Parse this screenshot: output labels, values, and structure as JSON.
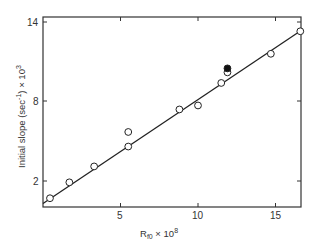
{
  "chart_data": {
    "type": "scatter",
    "title": "",
    "xlabel": "R_f0 × 10^8",
    "ylabel": "Initial slope (sec^-1) × 10^3",
    "xlim": [
      0,
      16.7
    ],
    "ylim": [
      0,
      14.3
    ],
    "x_ticks": [
      5,
      10,
      15
    ],
    "y_ticks": [
      2,
      8,
      14
    ],
    "grid": false,
    "legend": null,
    "series": [
      {
        "name": "open circles",
        "marker": "open-circle",
        "points": [
          [
            0.45,
            0.7
          ],
          [
            1.7,
            1.9
          ],
          [
            3.3,
            3.1
          ],
          [
            5.5,
            5.7
          ],
          [
            5.5,
            4.6
          ],
          [
            8.8,
            7.4
          ],
          [
            10.0,
            7.7
          ],
          [
            11.5,
            9.4
          ],
          [
            11.9,
            10.2
          ],
          [
            14.7,
            11.6
          ],
          [
            16.6,
            13.3
          ]
        ]
      },
      {
        "name": "filled circle",
        "marker": "filled-circle",
        "points": [
          [
            11.9,
            10.5
          ]
        ]
      },
      {
        "name": "fit line",
        "type": "line",
        "points": [
          [
            0,
            0.3
          ],
          [
            16.7,
            13.4
          ]
        ]
      }
    ]
  },
  "labels": {
    "xlabel_main": "R",
    "xlabel_sub": "f0",
    "xlabel_rest": " × 10",
    "xlabel_sup": "8",
    "ylabel_main": "Initial slope (sec",
    "ylabel_sup": "-1",
    "ylabel_rest": ") × 10",
    "ylabel_sup2": "3",
    "x_tick_5": "5",
    "x_tick_10": "10",
    "x_tick_15": "15",
    "y_tick_2": "2",
    "y_tick_8": "8",
    "y_tick_14": "14"
  }
}
